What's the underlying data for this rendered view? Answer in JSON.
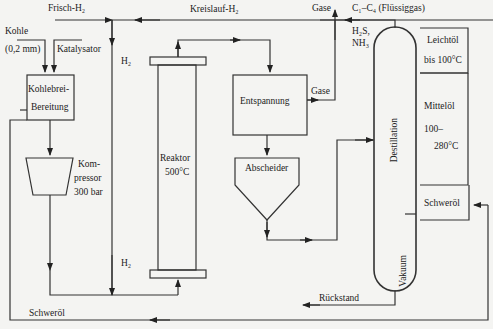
{
  "diagram": {
    "type": "process-flow",
    "inputs": {
      "frisch_h2": "Frisch-H₂",
      "kreislauf_h2": "Kreislauf-H₂",
      "kohle": "Kohle",
      "kohle_size": "(0,2 mm)",
      "katalysator": "Katalysator"
    },
    "units": {
      "kohlebrei_1": "Kohlebrei-",
      "kohlebrei_2": "Bereitung",
      "kompressor_1": "Kom-",
      "kompressor_2": "pressor",
      "kompressor_3": "300 bar",
      "reaktor_1": "Reaktor",
      "reaktor_2": "500°C",
      "entspannung": "Entspannung",
      "abscheider": "Abscheider",
      "destillation": "Destillation",
      "vakuum": "Vakuum"
    },
    "streams": {
      "h2_top": "H₂",
      "h2_bottom": "H₂",
      "gase_top": "Gase",
      "gase_mid": "Gase",
      "c1c4": "C₁–C₄ (Flüssiggas)",
      "h2s": "H₂S,",
      "nh3": "NH₃",
      "rueckstand": "Rückstand",
      "schweroel_bottom": "Schweröl"
    },
    "products": {
      "leichtoel_1": "Leichtöl",
      "leichtoel_2": "bis 100°C",
      "mitteloel_1": "Mittelöl",
      "mitteloel_2": "100–",
      "mitteloel_3": "280°C",
      "schweroel": "Schweröl"
    }
  }
}
